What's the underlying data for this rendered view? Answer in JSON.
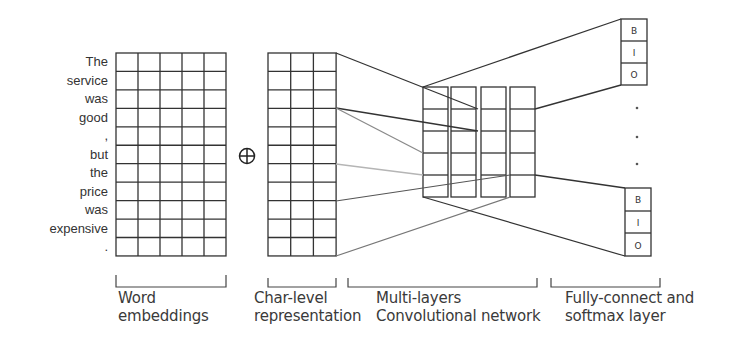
{
  "diagram": {
    "tokens": [
      "The",
      "service",
      "was",
      "good",
      ",",
      "but",
      "the",
      "price",
      "was",
      "expensive",
      "."
    ],
    "concat_symbol": "⊕",
    "word_embeddings": {
      "rows": 11,
      "cols": 5
    },
    "char_level": {
      "rows": 11,
      "cols": 3
    },
    "cnn": {
      "columns": 4,
      "rows_per_column": 5
    },
    "output_labels": {
      "top": [
        "B",
        "I",
        "O"
      ],
      "bottom": [
        "B",
        "I",
        "O"
      ]
    },
    "ellipsis": "⋮",
    "captions": {
      "word": "Word\nembeddings",
      "char": "Char-level\nrepresentation",
      "cnn": "Multi-layers\nConvolutional network",
      "fc": "Fully-connect and\nsoftmax layer"
    },
    "colors": {
      "line_dark": "#333333",
      "line_gray": "#8a8a8a",
      "line_faint": "#b5b5b5",
      "text": "#333333"
    }
  }
}
